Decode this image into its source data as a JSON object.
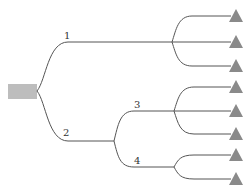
{
  "diagram": {
    "type": "tree",
    "root": {
      "shape": "rectangle",
      "color": "#bdbdbd"
    },
    "leaf_color": "#8a8a8a",
    "edge_color": "#555555",
    "branches": [
      {
        "label": "1",
        "leaves": 3
      },
      {
        "label": "2",
        "children": [
          {
            "label": "3",
            "leaves": 3
          },
          {
            "label": "4",
            "leaves": 2
          }
        ]
      }
    ],
    "labels": {
      "b1": "1",
      "b2": "2",
      "b3": "3",
      "b4": "4"
    },
    "leaf_count": 8
  }
}
